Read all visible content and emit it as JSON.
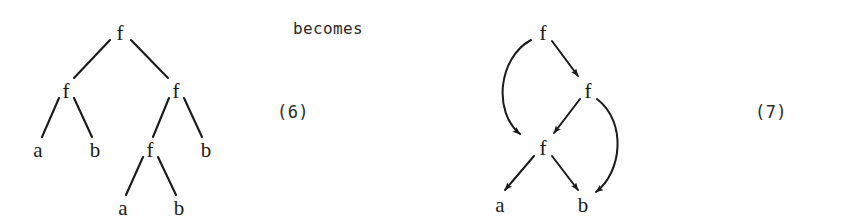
{
  "figure": {
    "caption_becomes": "becomes",
    "left_tag": "(6)",
    "right_tag": "(7)",
    "background_color": "#ffffff",
    "ink_color": "#1a1a1a"
  },
  "tree": {
    "title": "term tree",
    "nodes": [
      {
        "id": "t0",
        "label": "f",
        "x": 120,
        "y": 32
      },
      {
        "id": "t1",
        "label": "f",
        "x": 66,
        "y": 90
      },
      {
        "id": "t2",
        "label": "f",
        "x": 176,
        "y": 90
      },
      {
        "id": "t3",
        "label": "a",
        "x": 38,
        "y": 149
      },
      {
        "id": "t4",
        "label": "b",
        "x": 95,
        "y": 149
      },
      {
        "id": "t5",
        "label": "f",
        "x": 150,
        "y": 149
      },
      {
        "id": "t6",
        "label": "b",
        "x": 206,
        "y": 149
      },
      {
        "id": "t7",
        "label": "a",
        "x": 123,
        "y": 207
      },
      {
        "id": "t8",
        "label": "b",
        "x": 179,
        "y": 207
      }
    ],
    "edges": [
      {
        "from": "t0",
        "to": "t1"
      },
      {
        "from": "t0",
        "to": "t2"
      },
      {
        "from": "t1",
        "to": "t3"
      },
      {
        "from": "t1",
        "to": "t4"
      },
      {
        "from": "t2",
        "to": "t5"
      },
      {
        "from": "t2",
        "to": "t6"
      },
      {
        "from": "t5",
        "to": "t7"
      },
      {
        "from": "t5",
        "to": "t8"
      }
    ]
  },
  "dag": {
    "title": "term dag",
    "nodes": [
      {
        "id": "d0",
        "label": "f",
        "x": 543,
        "y": 32
      },
      {
        "id": "d1",
        "label": "f",
        "x": 588,
        "y": 90
      },
      {
        "id": "d2",
        "label": "f",
        "x": 543,
        "y": 147
      },
      {
        "id": "d3",
        "label": "a",
        "x": 500,
        "y": 204
      },
      {
        "id": "d4",
        "label": "b",
        "x": 583,
        "y": 204
      }
    ],
    "edges": [
      {
        "from": "d0",
        "to": "d2",
        "shape": "curve-left"
      },
      {
        "from": "d0",
        "to": "d1",
        "shape": "straight"
      },
      {
        "from": "d1",
        "to": "d2",
        "shape": "straight"
      },
      {
        "from": "d1",
        "to": "d4",
        "shape": "curve-right"
      },
      {
        "from": "d2",
        "to": "d3",
        "shape": "straight"
      },
      {
        "from": "d2",
        "to": "d4",
        "shape": "straight"
      }
    ]
  }
}
